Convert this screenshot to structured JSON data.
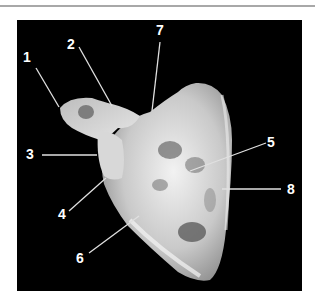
{
  "figure": {
    "background_color": "#000000",
    "label_color": "#ffffff",
    "labels": [
      {
        "id": "1",
        "text": "1",
        "x": 28,
        "y": 58
      },
      {
        "id": "2",
        "text": "2",
        "x": 72,
        "y": 45
      },
      {
        "id": "3",
        "text": "3",
        "x": 31,
        "y": 154
      },
      {
        "id": "4",
        "text": "4",
        "x": 63,
        "y": 214
      },
      {
        "id": "5",
        "text": "5",
        "x": 272,
        "y": 142
      },
      {
        "id": "6",
        "text": "6",
        "x": 81,
        "y": 259
      },
      {
        "id": "7",
        "text": "7",
        "x": 161,
        "y": 31
      },
      {
        "id": "8",
        "text": "8",
        "x": 292,
        "y": 189
      }
    ]
  }
}
